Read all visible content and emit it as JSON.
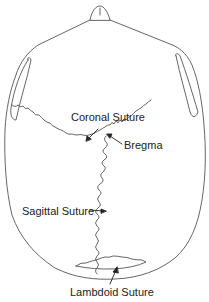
{
  "diagram": {
    "colors": {
      "line": "#555555",
      "text": "#222222",
      "background": "#ffffff"
    },
    "labels": [
      {
        "id": "coronal",
        "text": "Coronal Suture"
      },
      {
        "id": "bregma",
        "text": "Bregma"
      },
      {
        "id": "sagittal",
        "text": "Sagittal Suture"
      },
      {
        "id": "lambdoid",
        "text": "Lambdoid Suture"
      }
    ]
  }
}
